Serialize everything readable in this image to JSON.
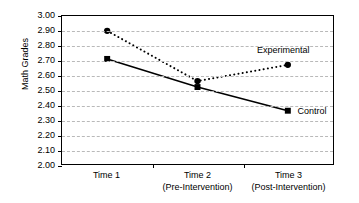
{
  "chart_data": {
    "type": "line",
    "title": "",
    "xlabel": "",
    "ylabel": "Math Grades",
    "categories": [
      "Time 1",
      "Time 2",
      "Time 3"
    ],
    "category_sublabels": [
      "",
      "(Pre-Intervention)",
      "(Post-Intervention)"
    ],
    "ylim": [
      2.0,
      3.0
    ],
    "ytick_labels": [
      "3.00",
      "2.90",
      "2.80",
      "2.70",
      "2.60",
      "2.50",
      "2.40",
      "2.30",
      "2.20",
      "2.10",
      "2.00"
    ],
    "ytick_values": [
      3.0,
      2.9,
      2.8,
      2.7,
      2.6,
      2.5,
      2.4,
      2.3,
      2.2,
      2.1,
      2.0
    ],
    "grid": true,
    "grid_axis": "y",
    "legend_position": "inline-annotation",
    "series": [
      {
        "name": "Experimental",
        "values": [
          2.9,
          2.56,
          2.67
        ],
        "line_style": "dotted",
        "marker": "circle",
        "color": "#000000"
      },
      {
        "name": "Control",
        "values": [
          2.71,
          2.52,
          2.36
        ],
        "line_style": "solid",
        "marker": "square",
        "color": "#000000"
      }
    ],
    "annotations": [
      {
        "text": "Experimental",
        "series": "Experimental"
      },
      {
        "text": "Control",
        "series": "Control"
      }
    ]
  },
  "axis": {
    "y_title": "Math Grades"
  }
}
